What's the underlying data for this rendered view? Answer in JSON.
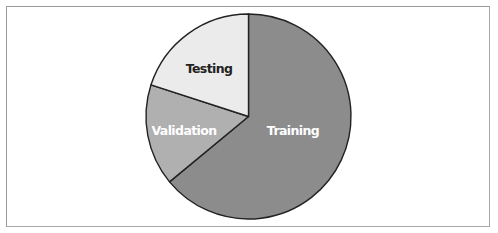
{
  "chart_data": {
    "type": "pie",
    "title": "",
    "categories": [
      "Training",
      "Validation",
      "Testing"
    ],
    "values": [
      64,
      16,
      20
    ],
    "unit": "%",
    "start_angle_deg": 0,
    "direction": "clockwise",
    "colors": [
      "#8c8c8c",
      "#b0b0b0",
      "#ebebeb"
    ],
    "label_colors": [
      "#ffffff",
      "#ffffff",
      "#222222"
    ],
    "legend": "none",
    "labels_inside": true
  },
  "labels": {
    "training": "Training",
    "validation": "Validation",
    "testing": "Testing"
  }
}
